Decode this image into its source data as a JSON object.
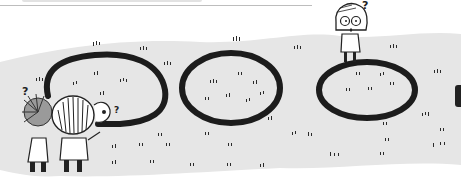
{
  "illustration": {
    "description": "Hand-drawn cartoon: two children seen from behind at the left, a boy peeking from behind them, a long looping line leading to three oval outlines on a grassy field; a girl with glasses stands on the rightmost oval looking puzzled.",
    "colors": {
      "ink": "#1c1c1c",
      "ground": "#e4e4e4",
      "paper": "#ffffff"
    },
    "question_marks": [
      "?",
      "?",
      "?"
    ],
    "elements": {
      "ovals": 3,
      "children_left": 2,
      "peeking_boy": 1,
      "girl_right": 1
    }
  }
}
